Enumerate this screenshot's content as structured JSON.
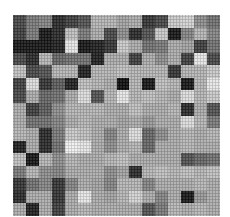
{
  "image": {
    "description": "Halftoned pixelated grayscale mosaic",
    "grid": {
      "cols": 16,
      "rows": 16
    },
    "gray_levels": [
      [
        70,
        120,
        130,
        40,
        60,
        80,
        180,
        180,
        160,
        170,
        50,
        70,
        200,
        210,
        140,
        110
      ],
      [
        60,
        120,
        20,
        40,
        190,
        120,
        170,
        70,
        140,
        40,
        80,
        200,
        20,
        130,
        180,
        130
      ],
      [
        20,
        20,
        20,
        30,
        230,
        20,
        30,
        50,
        200,
        170,
        110,
        120,
        170,
        160,
        60,
        110
      ],
      [
        70,
        40,
        180,
        100,
        110,
        110,
        30,
        170,
        170,
        60,
        170,
        140,
        170,
        60,
        230,
        70
      ],
      [
        190,
        70,
        80,
        180,
        180,
        30,
        180,
        180,
        190,
        180,
        180,
        180,
        50,
        180,
        180,
        200
      ],
      [
        60,
        220,
        50,
        90,
        30,
        190,
        180,
        170,
        10,
        180,
        20,
        190,
        180,
        20,
        180,
        230
      ],
      [
        70,
        170,
        100,
        110,
        170,
        220,
        80,
        180,
        230,
        180,
        190,
        180,
        170,
        220,
        180,
        200
      ],
      [
        170,
        60,
        90,
        140,
        180,
        180,
        180,
        170,
        170,
        190,
        170,
        170,
        180,
        40,
        170,
        80
      ],
      [
        170,
        110,
        110,
        130,
        170,
        180,
        170,
        170,
        160,
        170,
        150,
        170,
        170,
        220,
        180,
        120
      ],
      [
        180,
        170,
        40,
        120,
        200,
        190,
        170,
        130,
        170,
        220,
        100,
        140,
        170,
        180,
        170,
        180
      ],
      [
        30,
        170,
        40,
        110,
        240,
        230,
        170,
        140,
        170,
        180,
        100,
        170,
        170,
        180,
        170,
        170
      ],
      [
        190,
        20,
        180,
        140,
        180,
        170,
        170,
        180,
        190,
        170,
        170,
        170,
        170,
        80,
        100,
        110
      ],
      [
        120,
        180,
        140,
        130,
        170,
        170,
        170,
        140,
        160,
        40,
        180,
        190,
        180,
        190,
        180,
        190
      ],
      [
        50,
        110,
        130,
        50,
        130,
        170,
        160,
        130,
        180,
        180,
        130,
        170,
        170,
        170,
        180,
        170
      ],
      [
        40,
        170,
        170,
        50,
        170,
        230,
        170,
        160,
        180,
        210,
        170,
        130,
        170,
        20,
        150,
        170
      ],
      [
        170,
        30,
        170,
        60,
        170,
        180,
        170,
        170,
        170,
        170,
        80,
        120,
        180,
        170,
        180,
        170
      ]
    ]
  }
}
